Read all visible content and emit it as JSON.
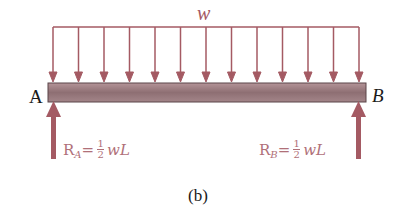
{
  "figure": {
    "load_label": "w",
    "left_support_label": "A",
    "right_support_label": "B",
    "caption": "(b)",
    "reaction_left": {
      "symbol": "R",
      "subscript": "A",
      "equals": "=",
      "numerator": "1",
      "denominator": "2",
      "expr": "wL"
    },
    "reaction_right": {
      "symbol": "R",
      "subscript": "B",
      "equals": "=",
      "numerator": "1",
      "denominator": "2",
      "expr": "wL"
    },
    "distributed_load_arrow_count": 13,
    "colors": {
      "arrow": "#a45a63",
      "beam": "#9a7a7e",
      "beam_edge": "#5a4448",
      "text": "#1a1a1a",
      "reaction_text": "#b07078"
    }
  }
}
